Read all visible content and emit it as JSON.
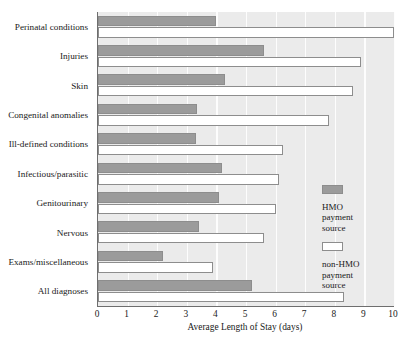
{
  "chart_data": {
    "type": "bar",
    "orientation": "horizontal",
    "title": "",
    "xlabel": "Average Length of Stay (days)",
    "ylabel": "",
    "xlim": [
      0,
      10
    ],
    "xticks": [
      "0",
      "1",
      "2",
      "3",
      "4",
      "5",
      "6",
      "7",
      "8",
      "9",
      "10"
    ],
    "grid": "vertical",
    "legend_position": "right-middle",
    "categories": [
      "Perinatal conditions",
      "Injuries",
      "Skin",
      "Congenital anomalies",
      "Ill-defined conditions",
      "Infectious/parasitic",
      "Genitourinary",
      "Nervous",
      "Exams/miscellaneous",
      "All diagnoses"
    ],
    "series": [
      {
        "name": "HMO payment source",
        "color": "#9b9b9b",
        "values": [
          4.0,
          5.6,
          4.3,
          3.35,
          3.3,
          4.2,
          4.1,
          3.4,
          2.2,
          5.2
        ]
      },
      {
        "name": "non-HMO payment source",
        "color": "#ffffff",
        "values": [
          10.0,
          8.9,
          8.6,
          7.8,
          6.25,
          6.1,
          6.0,
          5.6,
          3.9,
          8.3
        ]
      }
    ]
  },
  "legend": {
    "entries": [
      {
        "swatch": "hmo",
        "line1": "HMO",
        "line2": "payment",
        "line3": "source"
      },
      {
        "swatch": "nonhmo",
        "line1": "non-HMO",
        "line2": "payment",
        "line3": "source"
      }
    ]
  },
  "colors": {
    "plot_background": "#ebebeb",
    "gridline": "#fdfdfd",
    "axis": "#6e6e6e",
    "bar_hmo_fill": "#9b9b9b",
    "bar_outline": "#8d8d8d",
    "bar_nonhmo_fill": "#ffffff",
    "text": "#1a1a1a"
  }
}
